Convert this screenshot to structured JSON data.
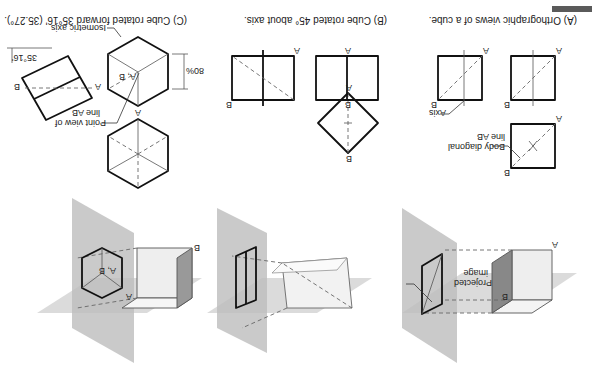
{
  "figure": {
    "orientation": "rotated 180 degrees",
    "corner_bar_color": "#5a5a5a",
    "panels": [
      {
        "id": "A",
        "caption": "(A) Orthographic views of a cube.",
        "labels": {
          "projected_image": "Projected\nimage",
          "projected_line1": "Projected",
          "projected_line2": "image",
          "body_diagonal_line1": "Body diagonal",
          "body_diagonal_line2": "line AB",
          "axis": "Axis",
          "point_a": "A",
          "point_b": "B"
        }
      },
      {
        "id": "B",
        "caption": "(B) Cube rotated 45° about axis.",
        "labels": {
          "point_a": "A",
          "point_b": "B"
        }
      },
      {
        "id": "C",
        "caption": "(C) Cube rotated forward 35°16' (35.27°).",
        "labels": {
          "point_view_line1": "Point view of",
          "point_view_line2": "line AB",
          "isometric_axis": "Isometric axis",
          "percent_80": "80%",
          "angle": "35°16'",
          "point_ab": "A, B",
          "point_a": "A",
          "point_b": "B"
        }
      }
    ]
  }
}
